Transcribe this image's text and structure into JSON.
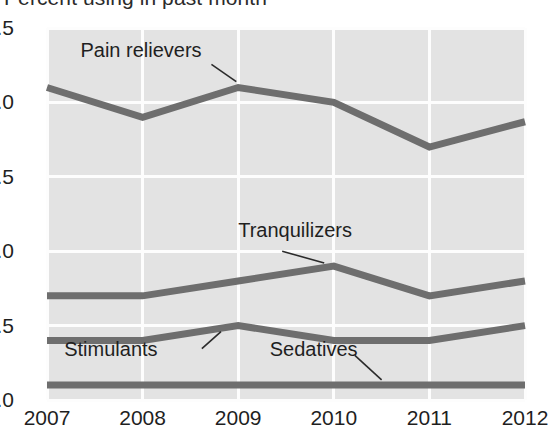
{
  "chart_data": {
    "type": "line",
    "title": "Percent using in past month",
    "subtitle": "",
    "xlabel": "",
    "ylabel": "",
    "categories": [
      "2007",
      "2008",
      "2009",
      "2010",
      "2011",
      "2012"
    ],
    "x": [
      2007,
      2008,
      2009,
      2010,
      2011,
      2012
    ],
    "xlim": [
      2007,
      2012
    ],
    "ylim": [
      0.0,
      2.5
    ],
    "yticks": [
      "0.0",
      "0.5",
      "1.0",
      "1.5",
      "2.0",
      "2.5"
    ],
    "ytick_values": [
      0.0,
      0.5,
      1.0,
      1.5,
      2.0,
      2.5
    ],
    "grid": true,
    "legend_position": "inline-annotations",
    "plot_background": "#e3e3e3",
    "gridline_color": "#fdfdfd",
    "line_color": "#6e6e6e",
    "series": [
      {
        "name": "Pain relievers",
        "values": [
          2.1,
          1.9,
          2.1,
          2.0,
          1.7,
          1.87
        ],
        "label_x": 2007.35,
        "label_y": 2.33,
        "leader_from": [
          2008.72,
          2.255
        ],
        "leader_to": [
          2008.98,
          2.14
        ]
      },
      {
        "name": "Tranquilizers",
        "values": [
          0.7,
          0.7,
          0.8,
          0.9,
          0.7,
          0.8
        ],
        "label_x": 2009.0,
        "label_y": 1.12,
        "leader_from": [
          2009.46,
          1.0
        ],
        "leader_to": [
          2009.9,
          0.92
        ]
      },
      {
        "name": "Stimulants",
        "values": [
          0.4,
          0.4,
          0.5,
          0.4,
          0.4,
          0.5
        ],
        "label_x": 2007.18,
        "label_y": 0.32,
        "leader_from": [
          2008.62,
          0.345
        ],
        "leader_to": [
          2008.82,
          0.46
        ]
      },
      {
        "name": "Sedatives",
        "values": [
          0.1,
          0.1,
          0.1,
          0.1,
          0.1,
          0.1
        ],
        "label_x": 2009.33,
        "label_y": 0.32,
        "leader_from": [
          2010.22,
          0.3
        ],
        "leader_to": [
          2010.5,
          0.135
        ]
      }
    ]
  }
}
